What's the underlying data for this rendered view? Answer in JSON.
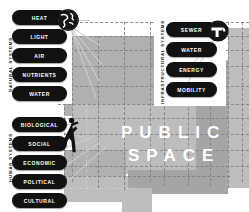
{
  "diagram": {
    "title_fragment": "",
    "center": {
      "line1": "PUBLIC",
      "line2": "SPACE"
    },
    "groups": [
      {
        "id": "natural",
        "caption": "NATURAL SYSTEMS",
        "icon": "globe-icon",
        "items": [
          {
            "label": "HEAT"
          },
          {
            "label": "LIGHT"
          },
          {
            "label": "AIR"
          },
          {
            "label": "NUTRIENTS"
          },
          {
            "label": "WATER"
          }
        ]
      },
      {
        "id": "infrastructural",
        "caption": "INFRASTRUCTURAL SYSTEMS",
        "icon": "faucet-icon",
        "items": [
          {
            "label": "SEWER"
          },
          {
            "label": "WATER"
          },
          {
            "label": "ENERGY"
          },
          {
            "label": "MOBILITY"
          }
        ]
      },
      {
        "id": "human",
        "caption": "HUMAN SYSTEMS",
        "icon": "pedestrian-icon",
        "items": [
          {
            "label": "BIOLOGICAL"
          },
          {
            "label": "SOCIAL"
          },
          {
            "label": "ECONOMIC"
          },
          {
            "label": "POLITICAL"
          },
          {
            "label": "CULTURAL"
          }
        ]
      }
    ],
    "colors": {
      "pill_fill": "#111111",
      "pill_text": "#ffffff",
      "massing_gray": "#b0b0b0",
      "massing_light": "#bdbdbd",
      "massing_dark": "#a5a5a5",
      "grid_dash": "#7d7d7d",
      "background": "#ffffff"
    }
  }
}
